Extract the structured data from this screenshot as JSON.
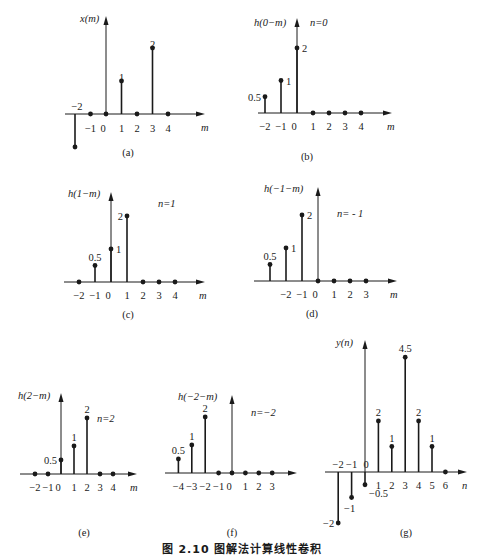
{
  "figure_caption": "图 2.10    图解法计算线性卷积",
  "chart_data": [
    {
      "id": "a",
      "type": "stem",
      "panel_label": "(a)",
      "ylabel": "x(m)",
      "xlabel": "m",
      "n_label": "",
      "tick_labels": [
        "−2",
        "−1",
        "0",
        "1",
        "2",
        "3",
        "4"
      ],
      "x": [
        -2,
        -1,
        0,
        1,
        2,
        3,
        4
      ],
      "values": [
        -1,
        0,
        0,
        1,
        0,
        2,
        0
      ],
      "value_labels": [
        {
          "x": -2,
          "text": "−2",
          "pos": "above-axis"
        },
        {
          "x": 1,
          "text": "1"
        },
        {
          "x": 3,
          "text": "2"
        }
      ],
      "geom": {
        "ox": 106,
        "oy": 114,
        "dx": 15.5,
        "unit": 33,
        "axis_x0": 65,
        "axis_x1": 205,
        "axis_top": 16,
        "xlabel_x": 201,
        "xlabel_y": 128,
        "ylabel_x": 80,
        "ylabel_y": 22,
        "cap_x": 128,
        "cap_y": 156,
        "tick_y": 129
      }
    },
    {
      "id": "b",
      "type": "stem",
      "panel_label": "(b)",
      "ylabel": "h(0−m)",
      "xlabel": "m",
      "n_label": "n=0",
      "tick_labels": [
        "−2",
        "−1",
        "0",
        "1",
        "2",
        "3",
        "4"
      ],
      "x": [
        -2,
        -1,
        0,
        1,
        2,
        3,
        4
      ],
      "values": [
        0.5,
        1,
        2,
        0,
        0,
        0,
        0
      ],
      "value_labels": [
        {
          "x": -2,
          "text": "0.5",
          "pos": "left"
        },
        {
          "x": -1,
          "text": "1",
          "pos": "right"
        },
        {
          "x": 0,
          "text": "2",
          "pos": "right"
        }
      ],
      "geom": {
        "ox": 297,
        "oy": 113,
        "dx": 16,
        "unit": 32.5,
        "axis_x0": 258,
        "axis_x1": 392,
        "axis_top": 18,
        "xlabel_x": 387,
        "xlabel_y": 127,
        "ylabel_x": 254,
        "ylabel_y": 26,
        "nlabel_x": 310,
        "nlabel_y": 26,
        "cap_x": 307,
        "cap_y": 160,
        "tick_y": 127
      }
    },
    {
      "id": "c",
      "type": "stem",
      "panel_label": "(c)",
      "ylabel": "h(1−m)",
      "xlabel": "m",
      "n_label": "n=1",
      "tick_labels": [
        "−2",
        "−1",
        "0",
        "1",
        "2",
        "3",
        "4"
      ],
      "x": [
        -2,
        -1,
        0,
        1,
        2,
        3,
        4
      ],
      "values": [
        0,
        0.5,
        1,
        2,
        0,
        0,
        0
      ],
      "value_labels": [
        {
          "x": -1,
          "text": "0.5",
          "pos": "above"
        },
        {
          "x": 0,
          "text": "1",
          "pos": "right"
        },
        {
          "x": 1,
          "text": "2",
          "pos": "left"
        }
      ],
      "geom": {
        "ox": 111,
        "oy": 282,
        "dx": 16,
        "unit": 33,
        "axis_x0": 64,
        "axis_x1": 205,
        "axis_top": 192,
        "xlabel_x": 199,
        "xlabel_y": 296,
        "ylabel_x": 68,
        "ylabel_y": 197,
        "nlabel_x": 158,
        "nlabel_y": 207,
        "cap_x": 128,
        "cap_y": 318,
        "tick_y": 296
      }
    },
    {
      "id": "d",
      "type": "stem",
      "panel_label": "(d)",
      "ylabel": "h(−1−m)",
      "xlabel": "m",
      "n_label": "n= - 1",
      "tick_labels": [
        "",
        "−2",
        "−1",
        "0",
        "1",
        "2",
        "3"
      ],
      "x": [
        -3,
        -2,
        -1,
        0,
        1,
        2,
        3
      ],
      "values": [
        0.5,
        1,
        2,
        0,
        0,
        0,
        0
      ],
      "value_labels": [
        {
          "x": -3,
          "text": "0.5",
          "pos": "above"
        },
        {
          "x": -2,
          "text": "1",
          "pos": "right"
        },
        {
          "x": -1,
          "text": "2",
          "pos": "right"
        }
      ],
      "geom": {
        "ox": 318,
        "oy": 281,
        "dx": 16,
        "unit": 33,
        "axis_x0": 254,
        "axis_x1": 397,
        "axis_top": 187,
        "xlabel_x": 390,
        "xlabel_y": 295,
        "ylabel_x": 264,
        "ylabel_y": 192,
        "nlabel_x": 337,
        "nlabel_y": 217,
        "cap_x": 312,
        "cap_y": 317,
        "tick_y": 295
      }
    },
    {
      "id": "e",
      "type": "stem",
      "panel_label": "(e)",
      "ylabel": "h(2−m)",
      "xlabel": "m",
      "n_label": "n=2",
      "tick_labels": [
        "−2",
        "−1",
        "0",
        "1",
        "2",
        "3",
        "4"
      ],
      "x": [
        -2,
        -1,
        0,
        1,
        2,
        3,
        4
      ],
      "values": [
        0,
        0,
        0.5,
        1,
        2,
        0,
        0
      ],
      "value_labels": [
        {
          "x": 0,
          "text": "0.5",
          "pos": "left"
        },
        {
          "x": 1,
          "text": "1",
          "pos": "above"
        },
        {
          "x": 2,
          "text": "2",
          "pos": "above"
        }
      ],
      "geom": {
        "ox": 61,
        "oy": 474,
        "dx": 13,
        "unit": 28,
        "axis_x0": 20,
        "axis_x1": 137,
        "axis_top": 393,
        "xlabel_x": 130,
        "xlabel_y": 488,
        "ylabel_x": 18,
        "ylabel_y": 399,
        "nlabel_x": 97,
        "nlabel_y": 422,
        "cap_x": 84,
        "cap_y": 536,
        "tick_y": 488
      }
    },
    {
      "id": "f",
      "type": "stem",
      "panel_label": "(f)",
      "ylabel": "h(−2−m)",
      "xlabel": "",
      "n_label": "n=−2",
      "tick_labels": [
        "−4",
        "−3",
        "−2",
        "−1",
        "0",
        "1",
        "2",
        "3"
      ],
      "x": [
        -4,
        -3,
        -2,
        -1,
        0,
        1,
        2,
        3
      ],
      "values": [
        0.5,
        1,
        2,
        0,
        0,
        0,
        0,
        0
      ],
      "value_labels": [
        {
          "x": -4,
          "text": "0.5",
          "pos": "above"
        },
        {
          "x": -3,
          "text": "1",
          "pos": "above"
        },
        {
          "x": -2,
          "text": "2",
          "pos": "above"
        }
      ],
      "geom": {
        "ox": 232,
        "oy": 473,
        "dx": 13.4,
        "unit": 28,
        "axis_x0": 165,
        "axis_x1": 297,
        "axis_top": 395,
        "xlabel_x": 0,
        "xlabel_y": 0,
        "ylabel_x": 178,
        "ylabel_y": 400,
        "nlabel_x": 251,
        "nlabel_y": 416,
        "cap_x": 232,
        "cap_y": 536,
        "tick_y": 487
      }
    },
    {
      "id": "g",
      "type": "stem",
      "panel_label": "(g)",
      "ylabel": "y(n)",
      "xlabel": "n",
      "n_label": "",
      "tick_labels": [
        "−2",
        "−1",
        "0",
        "1",
        "2",
        "3",
        "4",
        "5",
        "6"
      ],
      "x": [
        -2,
        -1,
        0,
        1,
        2,
        3,
        4,
        5,
        6
      ],
      "values": [
        -2,
        -1,
        -0.5,
        2,
        1,
        4.5,
        2,
        1,
        0
      ],
      "value_labels": [
        {
          "x": -2,
          "text": "−2",
          "pos": "left"
        },
        {
          "x": -1,
          "text": "−1",
          "pos": "below"
        },
        {
          "x": 0,
          "text": "−0.5",
          "pos": "right-below"
        },
        {
          "x": 1,
          "text": "2",
          "pos": "above"
        },
        {
          "x": 2,
          "text": "1",
          "pos": "above"
        },
        {
          "x": 3,
          "text": "4.5",
          "pos": "above"
        },
        {
          "x": 4,
          "text": "2",
          "pos": "above"
        },
        {
          "x": 5,
          "text": "1",
          "pos": "above"
        }
      ],
      "geom": {
        "ox": 365,
        "oy": 472,
        "dx": 13.4,
        "unit": 25.5,
        "axis_x0": 325,
        "axis_x1": 467,
        "axis_top": 340,
        "xlabel_x": 462,
        "xlabel_y": 486,
        "ylabel_x": 336,
        "ylabel_y": 346,
        "cap_x": 406,
        "cap_y": 536,
        "tick_y": 486
      }
    }
  ]
}
